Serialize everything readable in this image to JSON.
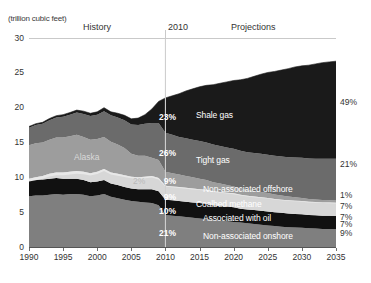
{
  "header": {
    "unit": "(trillion cubic feet)",
    "history_label": "History",
    "divider_year": "2010",
    "projections_label": "Projections"
  },
  "chart_data": {
    "type": "area",
    "stacked": true,
    "title": "",
    "xlabel": "",
    "ylabel": "(trillion cubic feet)",
    "xlim": [
      1990,
      2035
    ],
    "ylim": [
      0,
      30
    ],
    "ytick_values": [
      0,
      5,
      10,
      15,
      20,
      25,
      30
    ],
    "xtick_values": [
      1990,
      1995,
      2000,
      2005,
      2010,
      2015,
      2020,
      2025,
      2030,
      2035
    ],
    "grid": false,
    "legend": "inline-labels",
    "divider_x": 2010,
    "x": [
      1990,
      1991,
      1992,
      1993,
      1994,
      1995,
      1996,
      1997,
      1998,
      1999,
      2000,
      2001,
      2002,
      2003,
      2004,
      2005,
      2006,
      2007,
      2008,
      2009,
      2010,
      2011,
      2012,
      2013,
      2014,
      2015,
      2016,
      2017,
      2018,
      2019,
      2020,
      2021,
      2022,
      2023,
      2024,
      2025,
      2026,
      2027,
      2028,
      2029,
      2030,
      2031,
      2032,
      2033,
      2034,
      2035
    ],
    "series": [
      {
        "name": "Non-associated onshore",
        "color": "#7f7f7f",
        "share_2010": "21%",
        "share_2035": "9%",
        "values": [
          7.3,
          7.4,
          7.4,
          7.5,
          7.6,
          7.5,
          7.6,
          7.6,
          7.5,
          7.3,
          7.4,
          7.6,
          7.2,
          7.0,
          6.8,
          6.6,
          6.5,
          6.4,
          6.3,
          6.0,
          4.6,
          4.5,
          4.4,
          4.3,
          4.2,
          4.1,
          4.0,
          3.9,
          3.8,
          3.7,
          3.6,
          3.5,
          3.4,
          3.3,
          3.2,
          3.1,
          3.0,
          2.9,
          2.85,
          2.8,
          2.75,
          2.7,
          2.65,
          2.6,
          2.58,
          2.55
        ]
      },
      {
        "name": "Associated with oil",
        "color": "#111111",
        "share_2010": "10%",
        "share_2035": "7%",
        "values": [
          2.3,
          2.3,
          2.3,
          2.3,
          2.3,
          2.3,
          2.2,
          2.2,
          2.1,
          2.0,
          2.0,
          2.0,
          1.9,
          1.9,
          1.8,
          1.8,
          1.8,
          1.9,
          2.0,
          2.0,
          2.2,
          2.2,
          2.2,
          2.2,
          2.2,
          2.2,
          2.2,
          2.1,
          2.1,
          2.1,
          2.1,
          2.0,
          2.0,
          2.0,
          2.0,
          2.0,
          2.0,
          2.0,
          1.95,
          1.95,
          1.95,
          1.9,
          1.9,
          1.9,
          1.9,
          1.9
        ]
      },
      {
        "name": "Coalbed methane",
        "color": "#d7d7d7",
        "share_2010": "9%",
        "share_2035": "7%",
        "values": [
          0.2,
          0.3,
          0.5,
          0.7,
          0.8,
          0.9,
          1.0,
          1.1,
          1.2,
          1.3,
          1.4,
          1.6,
          1.6,
          1.6,
          1.7,
          1.7,
          1.7,
          1.8,
          1.9,
          1.9,
          2.0,
          2.0,
          2.0,
          2.0,
          2.0,
          2.0,
          2.0,
          2.0,
          2.0,
          2.0,
          2.0,
          2.0,
          1.95,
          1.95,
          1.95,
          1.95,
          1.9,
          1.9,
          1.9,
          1.9,
          1.9,
          1.9,
          1.9,
          1.9,
          1.9,
          1.9
        ]
      },
      {
        "name": "Non-associated offshore",
        "color": "#9d9d9d",
        "share_2010": "9%",
        "share_2035": "1%",
        "values": [
          4.8,
          4.9,
          4.8,
          4.9,
          5.0,
          5.0,
          5.1,
          5.2,
          5.0,
          4.8,
          4.7,
          4.6,
          4.4,
          4.2,
          3.9,
          3.3,
          3.1,
          3.0,
          2.6,
          2.6,
          2.0,
          1.9,
          1.8,
          1.7,
          1.6,
          1.5,
          1.4,
          1.3,
          1.2,
          1.1,
          1.0,
          0.9,
          0.85,
          0.8,
          0.75,
          0.7,
          0.65,
          0.6,
          0.55,
          0.5,
          0.45,
          0.4,
          0.38,
          0.36,
          0.34,
          0.32
        ]
      },
      {
        "name": "Tight gas",
        "color": "#6b6b6b",
        "share_2010": "26%",
        "share_2035": "21%",
        "values": [
          2.5,
          2.6,
          2.7,
          2.8,
          2.9,
          3.0,
          3.1,
          3.2,
          3.3,
          3.4,
          3.5,
          3.7,
          3.8,
          3.9,
          4.0,
          4.2,
          4.4,
          4.6,
          5.0,
          5.3,
          5.6,
          5.5,
          5.4,
          5.4,
          5.4,
          5.4,
          5.4,
          5.4,
          5.4,
          5.4,
          5.4,
          5.4,
          5.4,
          5.45,
          5.5,
          5.5,
          5.55,
          5.6,
          5.65,
          5.7,
          5.75,
          5.8,
          5.85,
          5.9,
          5.95,
          6.0
        ]
      },
      {
        "name": "Shale gas",
        "color": "#1a1a1a",
        "share_2010": "23%",
        "share_2035": "49%",
        "values": [
          0.2,
          0.2,
          0.2,
          0.25,
          0.25,
          0.3,
          0.3,
          0.35,
          0.4,
          0.4,
          0.4,
          0.5,
          0.5,
          0.6,
          0.7,
          0.8,
          1.0,
          1.3,
          2.0,
          3.1,
          5.0,
          5.6,
          6.2,
          6.8,
          7.3,
          7.8,
          8.2,
          8.6,
          9.0,
          9.4,
          9.8,
          10.2,
          10.6,
          11.0,
          11.4,
          11.8,
          12.1,
          12.4,
          12.7,
          13.0,
          13.2,
          13.4,
          13.6,
          13.8,
          13.9,
          14.0
        ]
      }
    ],
    "annotations": [
      {
        "name": "alaska",
        "text": "Alaska"
      },
      {
        "name": "alaska-pct",
        "text": "2%"
      }
    ]
  }
}
